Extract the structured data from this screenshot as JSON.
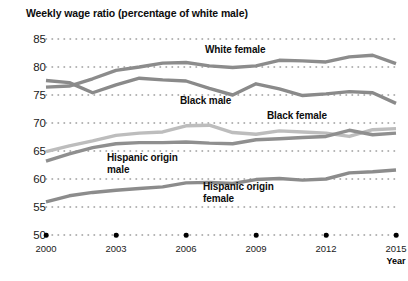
{
  "title": "Weekly wage ratio (percentage of white male)",
  "axis": {
    "x_axis_label": "Year",
    "y_ticks": [
      "85",
      "80",
      "75",
      "70",
      "65",
      "60",
      "55",
      "50"
    ],
    "x_ticks": [
      "2000",
      "2003",
      "2006",
      "2009",
      "2012",
      "2015"
    ]
  },
  "labels": {
    "white_female": "White female",
    "black_male": "Black male",
    "black_female": "Black female",
    "hispanic_male_line1": "Hispanic origin",
    "hispanic_male_line2": "male",
    "hispanic_female_line1": "Hispanic origin",
    "hispanic_female_line2": "female"
  },
  "colors": {
    "white_female": "#8c8c8c",
    "black_male": "#8a8a8a",
    "black_female": "#bdbdbd",
    "hispanic_male": "#8f8f8f",
    "hispanic_female": "#8c8c8c",
    "gridline": "#9a9a9a",
    "text": "#0d0d0d",
    "marker": "#000000"
  },
  "chart_data": {
    "type": "line",
    "title": "Weekly wage ratio (percentage of white male)",
    "xlabel": "Year",
    "ylabel": "",
    "xlim": [
      2000,
      2015
    ],
    "ylim": [
      50,
      85
    ],
    "ytick_step": 5,
    "grid": "dotted-horizontal",
    "legend": "inline-annotations",
    "x": [
      2000,
      2001,
      2002,
      2003,
      2004,
      2005,
      2006,
      2007,
      2008,
      2009,
      2010,
      2011,
      2012,
      2013,
      2014,
      2015
    ],
    "series": [
      {
        "name": "White female",
        "color": "#8c8c8c",
        "values": [
          76.4,
          76.6,
          77.9,
          79.4,
          80.0,
          80.7,
          80.8,
          80.2,
          79.9,
          80.2,
          81.2,
          81.1,
          80.9,
          81.8,
          82.1,
          80.6
        ]
      },
      {
        "name": "Black male",
        "color": "#8a8a8a",
        "values": [
          77.6,
          77.2,
          75.4,
          76.8,
          78.0,
          77.7,
          77.5,
          76.2,
          75.0,
          77.0,
          76.1,
          74.9,
          75.2,
          75.6,
          75.4,
          73.5
        ]
      },
      {
        "name": "Black female",
        "color": "#bdbdbd",
        "values": [
          64.9,
          65.9,
          66.8,
          67.8,
          68.2,
          68.4,
          69.5,
          69.6,
          68.3,
          68.0,
          68.6,
          68.4,
          68.2,
          67.6,
          68.8,
          69.0
        ]
      },
      {
        "name": "Hispanic origin male",
        "color": "#8f8f8f",
        "values": [
          63.2,
          64.5,
          65.6,
          66.3,
          66.5,
          66.5,
          66.6,
          66.4,
          66.3,
          67.0,
          67.2,
          67.4,
          67.6,
          68.7,
          67.9,
          68.2
        ]
      },
      {
        "name": "Hispanic origin female",
        "color": "#8c8c8c",
        "values": [
          55.9,
          57.0,
          57.6,
          58.0,
          58.3,
          58.6,
          59.3,
          59.4,
          59.2,
          59.9,
          60.1,
          59.8,
          60.0,
          61.1,
          61.3,
          61.6
        ]
      }
    ]
  }
}
